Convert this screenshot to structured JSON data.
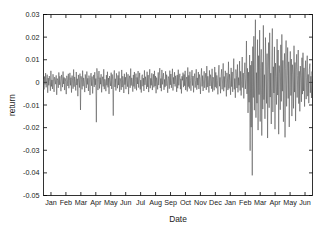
{
  "chart_data": {
    "type": "line",
    "title": "",
    "xlabel": "Date",
    "ylabel": "return",
    "ylim": [
      -0.05,
      0.03
    ],
    "yticks": [
      0.03,
      0.02,
      0.01,
      0,
      -0.01,
      -0.02,
      -0.03,
      -0.04,
      -0.05
    ],
    "ytick_labels": [
      "0.03",
      "0.02",
      "0.01",
      "0",
      "-0.01",
      "-0.02",
      "-0.03",
      "-0.04",
      "-0.05"
    ],
    "xtick_labels": [
      "Jan",
      "Feb",
      "Mar",
      "Apr",
      "May",
      "Jun",
      "Jul",
      "Aug",
      "Sep",
      "Oct",
      "Nov",
      "Dec",
      "Jan",
      "Feb",
      "Mar",
      "Apr",
      "May",
      "Jun"
    ],
    "xlim": [
      0,
      18
    ],
    "grid": false,
    "legend": null,
    "line_color": "#4d4d4d",
    "axis_color": "#000000",
    "background": "#ffffff",
    "series": [
      {
        "name": "return",
        "values": [
          0.0012,
          -0.0031,
          0.0026,
          -0.0009,
          0.0041,
          -0.0022,
          0.0008,
          0.0034,
          -0.0046,
          0.0019,
          -0.0013,
          0.0028,
          0.0003,
          -0.0037,
          0.0051,
          -0.0018,
          0.0011,
          -0.0029,
          0.0036,
          0.0006,
          -0.0042,
          0.0023,
          0.0014,
          -0.0008,
          0.0031,
          -0.0055,
          0.0017,
          0.0009,
          -0.0024,
          0.0044,
          -0.0011,
          0.0027,
          0.0002,
          -0.0039,
          0.0033,
          0.0015,
          -0.0021,
          0.0048,
          -0.0007,
          0.0022,
          -0.0034,
          0.0018,
          0.0005,
          -0.0052,
          0.0029,
          0.0012,
          -0.0016,
          0.0038,
          -0.0026,
          0.0007,
          0.0042,
          -0.0013,
          0.0021,
          -0.0045,
          0.003,
          0.001,
          -0.0028,
          0.0057,
          -0.0019,
          0.0024,
          0.0004,
          -0.0036,
          0.0046,
          -0.0012,
          0.0016,
          -0.0061,
          0.0033,
          0.0008,
          -0.0023,
          0.0039,
          -0.0122,
          0.0027,
          0.0013,
          -0.0031,
          0.0052,
          -0.0017,
          0.002,
          0.0006,
          -0.0043,
          0.0035,
          0.0011,
          -0.0025,
          0.0048,
          -0.0009,
          0.0018,
          -0.0038,
          0.003,
          0.0014,
          -0.0056,
          0.0022,
          0.0041,
          -0.0015,
          0.0026,
          -0.0049,
          0.0008,
          0.0033,
          -0.002,
          0.0045,
          -0.0011,
          0.0017,
          -0.0176,
          0.0062,
          0.0029,
          -0.0034,
          0.0013,
          0.005,
          -0.0027,
          0.0021,
          -0.0008,
          0.0036,
          -0.0044,
          0.001,
          0.0025,
          -0.0018,
          0.0058,
          -0.003,
          0.0014,
          0.0004,
          -0.0039,
          0.0032,
          -0.0013,
          0.0047,
          -0.0022,
          0.0019,
          -0.0051,
          0.0028,
          0.0007,
          -0.0016,
          0.0043,
          -0.0029,
          0.0035,
          0.0011,
          -0.0147,
          0.0024,
          0.0053,
          -0.002,
          0.0016,
          -0.0036,
          0.004,
          0.0009,
          -0.0026,
          0.0031,
          -0.0012,
          0.0048,
          -0.0042,
          0.0018,
          0.0006,
          -0.0033,
          0.0055,
          -0.0021,
          0.0027,
          0.0013,
          -0.0047,
          0.0038,
          -0.001,
          0.0023,
          -0.003,
          0.0044,
          0.0008,
          -0.0019,
          0.0036,
          -0.0052,
          0.0015,
          0.0029,
          -0.0024,
          0.0061,
          -0.0014,
          0.002,
          0.0005,
          -0.0041,
          0.0033,
          -0.0018,
          0.0046,
          -0.0028,
          0.0012,
          0.0039,
          -0.0035,
          0.0022,
          -0.0007,
          0.005,
          -0.0023,
          0.0016,
          0.0042,
          -0.0031,
          0.001,
          -0.0045,
          0.0027,
          0.0034,
          -0.0017,
          0.0019,
          -0.0038,
          0.0053,
          -0.0011,
          0.0025,
          0.0007,
          -0.0029,
          0.0047,
          -0.002,
          0.0032,
          -0.0043,
          0.0014,
          0.0058,
          -0.0026,
          0.0018,
          -0.0013,
          0.004,
          -0.0034,
          0.0009,
          0.0036,
          -0.0022,
          0.0051,
          -0.0016,
          0.0028,
          -0.0048,
          0.0021,
          0.0006,
          -0.0031,
          0.0044,
          -0.0012,
          0.003,
          0.0063,
          -0.0025,
          0.0017,
          -0.0039,
          0.0055,
          -0.0009,
          0.0023,
          0.0041,
          -0.0033,
          0.0013,
          -0.0021,
          0.0049,
          -0.0015,
          0.0034,
          0.0008,
          -0.0046,
          0.0026,
          0.0019,
          -0.0028,
          0.0052,
          -0.0011,
          0.0037,
          -0.0024,
          0.0014,
          0.006,
          -0.0036,
          0.0022,
          -0.0007,
          0.0045,
          -0.0018,
          0.0029,
          0.0011,
          -0.0042,
          0.0033,
          -0.0026,
          0.0056,
          -0.0013,
          0.002,
          0.0038,
          -0.003,
          0.0016,
          -0.0049,
          0.0027,
          0.0009,
          0.0043,
          -0.0021,
          0.0035,
          -0.0015,
          0.0051,
          -0.0034,
          0.0012,
          0.0024,
          -0.004,
          0.0066,
          -0.0019,
          0.0031,
          -0.0027,
          0.0047,
          0.001,
          -0.0037,
          0.0022,
          0.0054,
          -0.0014,
          0.0028,
          -0.0044,
          0.0017,
          0.0039,
          -0.0023,
          0.0008,
          0.0058,
          -0.0032,
          0.002,
          -0.0012,
          0.0046,
          -0.0029,
          0.0035,
          0.0013,
          -0.0051,
          0.0025,
          0.0062,
          -0.0018,
          0.003,
          -0.0038,
          0.0011,
          0.0049,
          -0.0024,
          0.0016,
          0.0041,
          -0.0033,
          0.0072,
          -0.0021,
          0.0027,
          0.0006,
          -0.0045,
          0.0053,
          -0.0016,
          0.0034,
          0.0019,
          -0.0028,
          0.006,
          -0.0041,
          0.0023,
          0.0012,
          -0.0035,
          0.0068,
          -0.002,
          0.0044,
          -0.0026,
          0.0031,
          0.0009,
          -0.0053,
          0.0037,
          0.0076,
          -0.0017,
          0.0022,
          -0.0048,
          0.0029,
          0.0058,
          -0.0031,
          0.0015,
          0.0084,
          -0.0039,
          0.0026,
          -0.0022,
          0.0051,
          0.0013,
          -0.0062,
          0.0042,
          0.0019,
          -0.0034,
          0.0091,
          -0.0027,
          0.0036,
          0.0008,
          -0.0055,
          0.0064,
          -0.0019,
          0.0046,
          -0.0042,
          0.0024,
          0.0105,
          -0.0031,
          0.0017,
          -0.0068,
          0.0057,
          0.003,
          -0.0025,
          0.0079,
          -0.0044,
          0.0021,
          -0.0013,
          0.0094,
          -0.0036,
          0.0049,
          -0.0058,
          0.0028,
          0.0112,
          -0.0023,
          0.0041,
          -0.0071,
          0.0034,
          0.0087,
          -0.0029,
          0.0016,
          0.0183,
          -0.0051,
          0.0062,
          -0.0135,
          0.0045,
          -0.0088,
          0.0121,
          -0.0302,
          0.0076,
          -0.0198,
          0.0094,
          -0.0411,
          0.0158,
          -0.0067,
          0.0204,
          -0.0123,
          0.0081,
          0.0277,
          -0.0156,
          0.0043,
          -0.0092,
          0.0189,
          -0.0211,
          0.0118,
          -0.0054,
          0.0231,
          -0.0173,
          0.0067,
          0.0146,
          -0.0235,
          0.0089,
          -0.0118,
          0.0252,
          -0.0076,
          0.0034,
          -0.0161,
          0.0198,
          0.0072,
          -0.0093,
          0.0127,
          -0.0246,
          0.0058,
          0.0176,
          -0.0112,
          0.0219,
          -0.0065,
          0.0041,
          -0.0184,
          0.0103,
          0.0238,
          -0.0131,
          0.0069,
          -0.0047,
          0.0157,
          -0.0207,
          0.0085,
          0.0026,
          -0.0098,
          0.0191,
          -0.0056,
          0.0143,
          -0.0229,
          0.0074,
          0.0038,
          -0.0121,
          0.0166,
          -0.0084,
          0.0212,
          -0.0039,
          0.0097,
          -0.0174,
          0.0051,
          0.0128,
          -0.0243,
          0.0063,
          0.0185,
          -0.0106,
          0.0029,
          0.0154,
          -0.0071,
          0.0091,
          -0.0197,
          0.0046,
          0.0137,
          -0.0058,
          0.0103,
          -0.0149,
          0.0078,
          0.0035,
          -0.0115,
          0.0162,
          -0.0043,
          0.0088,
          -0.0171,
          0.0056,
          0.0124,
          -0.0067,
          0.0031,
          0.0143,
          -0.0094,
          0.0049,
          -0.0128,
          0.0072,
          0.0019,
          -0.0086,
          0.0109,
          -0.0052,
          0.0131,
          -0.0038,
          0.0064,
          -0.0107,
          0.0042,
          0.0096,
          -0.0074,
          0.0023,
          0.0118,
          -0.0061,
          0.0035,
          -0.0092,
          0.0057,
          0.0083,
          -0.0046,
          0.0027,
          -0.0069,
          0.0048,
          0.0014
        ]
      }
    ]
  }
}
